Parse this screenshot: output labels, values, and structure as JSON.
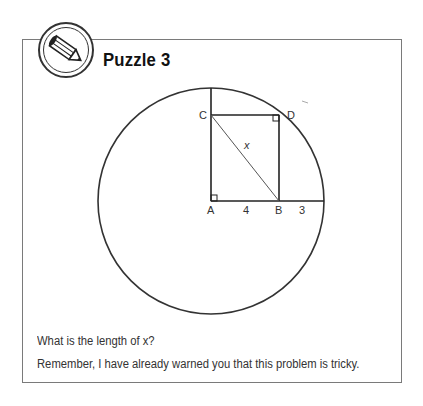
{
  "puzzle": {
    "title": "Puzzle 3",
    "icon": "pencil-icon",
    "figure": {
      "points": {
        "A": "A",
        "B": "B",
        "C": "C",
        "D": "D"
      },
      "labels": {
        "AB": "4",
        "B_to_edge": "3",
        "diagonal": "x"
      }
    },
    "question": "What is the length of x?",
    "note": "Remember, I have already warned you that this problem is tricky."
  }
}
